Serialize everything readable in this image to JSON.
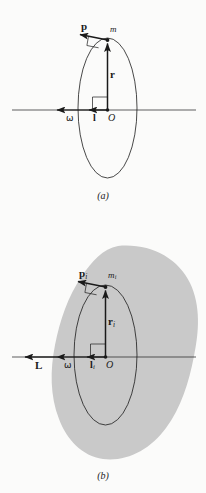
{
  "figure": {
    "kind": "physics-diagram",
    "background_color": "#fbfbfa",
    "ink_color": "#1a1a1a",
    "body_fill_color": "#c9c9c9"
  },
  "panel_a": {
    "caption": "(a)",
    "labels": {
      "momentum": "p",
      "mass": "m",
      "radius": "r",
      "angular_momentum": "l",
      "angular_velocity": "ω",
      "origin": "O"
    }
  },
  "panel_b": {
    "caption": "(b)",
    "labels": {
      "momentum": "p",
      "momentum_sub": "i",
      "mass": "m",
      "mass_sub": "i",
      "radius": "r",
      "radius_sub": "i",
      "angular_momentum": "l",
      "angular_momentum_sub": "i",
      "total_angular_momentum": "L",
      "angular_velocity": "ω",
      "origin": "O"
    }
  }
}
